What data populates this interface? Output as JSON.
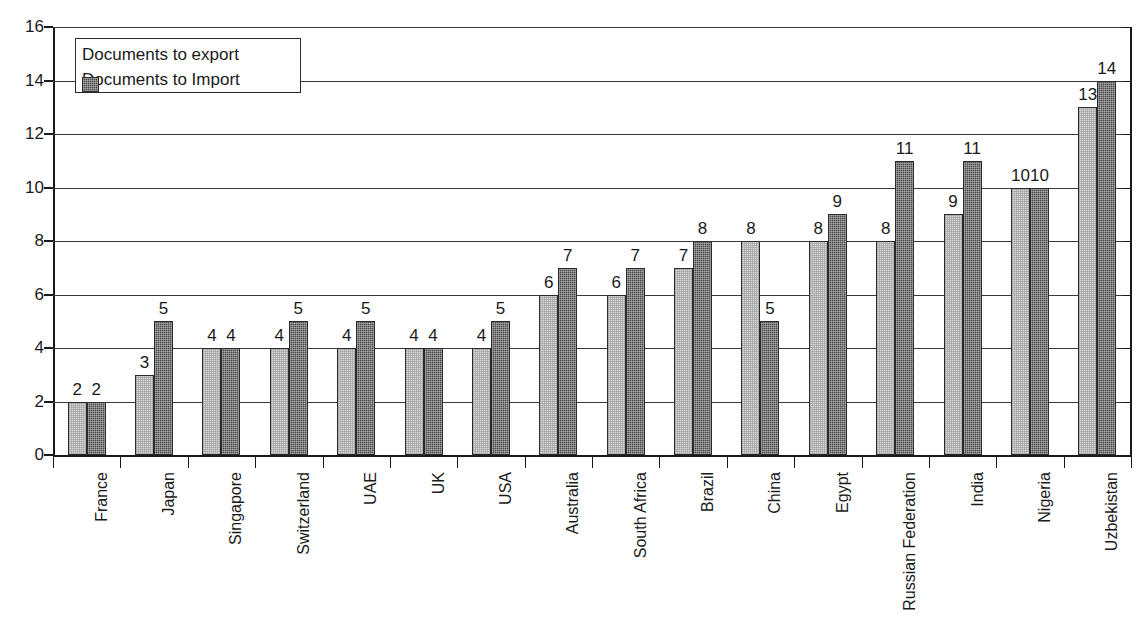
{
  "chart_data": {
    "type": "bar",
    "title": "",
    "subtitle": "",
    "xlabel": "",
    "ylabel": "",
    "ylim": [
      0,
      16
    ],
    "ytick_step": 2,
    "yticks": [
      "0",
      "2",
      "4",
      "6",
      "8",
      "10",
      "12",
      "14",
      "16"
    ],
    "grid": true,
    "legend_position": "top-left",
    "categories": [
      "France",
      "Japan",
      "Singapore",
      "Switzerland",
      "UAE",
      "UK",
      "USA",
      "Australia",
      "South Africa",
      "Brazil",
      "China",
      "Egypt",
      "Russian Federation",
      "India",
      "Nigeria",
      "Uzbekistan"
    ],
    "series": [
      {
        "name": "Documents to export",
        "color": "#d9d9d9",
        "values": [
          2,
          3,
          4,
          4,
          4,
          4,
          4,
          6,
          6,
          7,
          8,
          8,
          8,
          9,
          10,
          13
        ]
      },
      {
        "name": "Documents to Import",
        "color": "#4a4a4a",
        "values": [
          2,
          5,
          4,
          5,
          5,
          4,
          5,
          7,
          7,
          8,
          5,
          9,
          11,
          11,
          10,
          14
        ]
      }
    ]
  },
  "legend": {
    "items": [
      {
        "label": "Documents to export",
        "swatch": "light"
      },
      {
        "label": "Documents to Import",
        "swatch": "dark"
      }
    ]
  },
  "colors": {
    "export_bar": "#d9d9d9",
    "import_bar": "#4a4a4a",
    "axis": "#1a1a1a",
    "grid": "#3a3a3a",
    "background": "#ffffff"
  }
}
